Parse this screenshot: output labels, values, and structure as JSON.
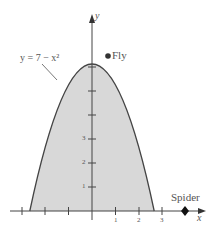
{
  "diagram": {
    "equation_label": "y = 7 − x²",
    "fly_label": "Fly",
    "spider_label": "Spider",
    "x_axis_label": "x",
    "y_axis_label": "y",
    "y_ticks": [
      "1",
      "2",
      "3"
    ],
    "x_ticks": [
      "1",
      "2",
      "3"
    ],
    "fill_color": "#d8d8d8",
    "curve_color": "#444444"
  }
}
